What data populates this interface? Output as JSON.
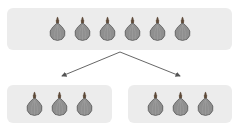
{
  "diagram": {
    "type": "division-split",
    "top_group": {
      "item": "onion",
      "count": 6
    },
    "bottom_groups": [
      {
        "item": "onion",
        "count": 3
      },
      {
        "item": "onion",
        "count": 3
      }
    ],
    "colors": {
      "box_fill": "#ececec",
      "onion_body": "#8f8f8f",
      "onion_stroke": "#5a5a5a",
      "onion_top": "#5e4a3a",
      "arrow": "#555555"
    }
  }
}
